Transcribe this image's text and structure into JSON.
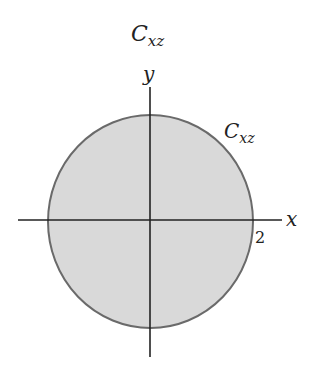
{
  "figure": {
    "title": {
      "main": "C",
      "subscript": "xz"
    },
    "axes": {
      "x_label": "x",
      "y_label": "y",
      "tick_label": "2"
    },
    "curve_label": {
      "main": "C",
      "subscript": "xz"
    },
    "colors": {
      "fill": "#d9d9d9",
      "stroke": "#666666",
      "axis": "#222222",
      "text": "#222222"
    }
  }
}
